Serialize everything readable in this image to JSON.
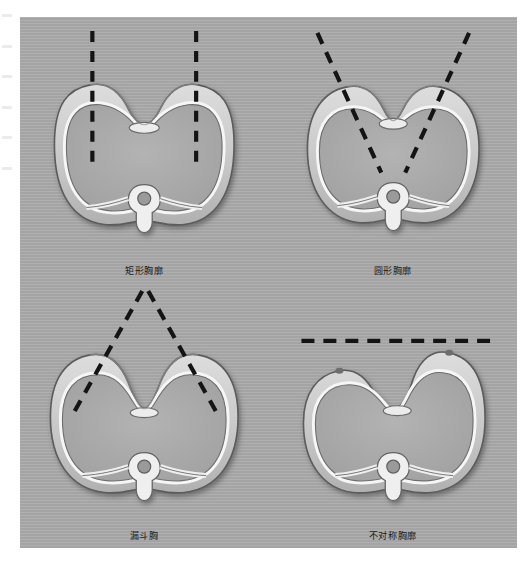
{
  "figure": {
    "background_color": "#aaaaaa",
    "line_color": "#141414",
    "tissue_light": "#d8d8d8",
    "tissue_mid": "#b9b9b9",
    "bone_white": "#f4f4f4",
    "outline_dark": "#4a4a4a",
    "panels": [
      {
        "id": "rectangular-thorax",
        "caption": "矩形胸廓",
        "marker_type": "vertical-parallel-dashed-lines",
        "marker_count": 2,
        "description_icon": "axial-chest-cross-section"
      },
      {
        "id": "round-thorax",
        "caption": "圆形胸廓",
        "marker_type": "converging-oblique-dashed-lines",
        "marker_count": 2,
        "description_icon": "axial-chest-cross-section"
      },
      {
        "id": "funnel-chest",
        "caption": "漏斗胸",
        "marker_type": "inverted-v-dashed-lines",
        "marker_count": 2,
        "description_icon": "axial-chest-cross-section"
      },
      {
        "id": "asymmetric-thorax",
        "caption": "不对称胸廓",
        "marker_type": "horizontal-dashed-line",
        "marker_count": 1,
        "description_icon": "axial-chest-cross-section"
      }
    ]
  },
  "edge_marginalia": {
    "visible": true,
    "legible": false,
    "mark_count": 6
  }
}
